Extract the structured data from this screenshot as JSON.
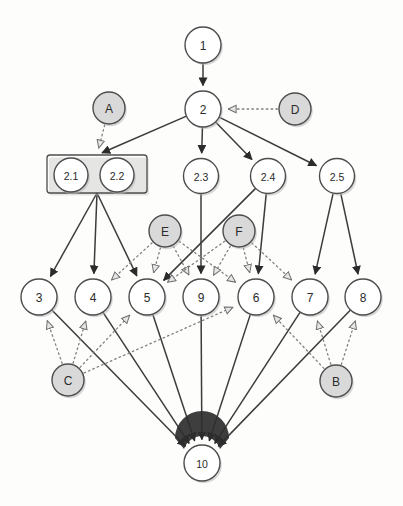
{
  "diagram": {
    "type": "directed-graph",
    "canvas": {
      "width": 403,
      "height": 506
    },
    "styles": {
      "plain_node_fill": "#ffffff",
      "shaded_node_fill": "#d9d9d9",
      "node_stroke": "#4d4d4d",
      "solid_edge_color": "#3c3c3c",
      "dotted_edge_color": "#808080",
      "background": "#fdfdfc"
    },
    "nodes": [
      {
        "id": "n1",
        "label": "1",
        "x": 203,
        "y": 45,
        "r": 18,
        "kind": "plain"
      },
      {
        "id": "n2",
        "label": "2",
        "x": 203,
        "y": 109,
        "r": 18,
        "kind": "plain"
      },
      {
        "id": "nA",
        "label": "A",
        "x": 109,
        "y": 108,
        "r": 16,
        "kind": "shaded"
      },
      {
        "id": "nD",
        "label": "D",
        "x": 295,
        "y": 109,
        "r": 16,
        "kind": "shaded"
      },
      {
        "id": "n21",
        "label": "2.1",
        "x": 71,
        "y": 175,
        "r": 17,
        "kind": "plain"
      },
      {
        "id": "n22",
        "label": "2.2",
        "x": 117,
        "y": 175,
        "r": 17,
        "kind": "plain"
      },
      {
        "id": "n23",
        "label": "2.3",
        "x": 201,
        "y": 176,
        "r": 17.5,
        "kind": "plain"
      },
      {
        "id": "n24",
        "label": "2.4",
        "x": 268,
        "y": 176,
        "r": 17.5,
        "kind": "plain"
      },
      {
        "id": "n25",
        "label": "2.5",
        "x": 337,
        "y": 176,
        "r": 17.5,
        "kind": "plain"
      },
      {
        "id": "nE",
        "label": "E",
        "x": 165,
        "y": 231,
        "r": 16,
        "kind": "shaded"
      },
      {
        "id": "nF",
        "label": "F",
        "x": 239,
        "y": 231,
        "r": 16,
        "kind": "shaded"
      },
      {
        "id": "n3",
        "label": "3",
        "x": 39,
        "y": 297,
        "r": 18,
        "kind": "plain"
      },
      {
        "id": "n4",
        "label": "4",
        "x": 93,
        "y": 297,
        "r": 18,
        "kind": "plain"
      },
      {
        "id": "n5",
        "label": "5",
        "x": 147,
        "y": 297,
        "r": 18,
        "kind": "plain"
      },
      {
        "id": "n9",
        "label": "9",
        "x": 201,
        "y": 297,
        "r": 18,
        "kind": "plain"
      },
      {
        "id": "n6",
        "label": "6",
        "x": 256,
        "y": 297,
        "r": 18,
        "kind": "plain"
      },
      {
        "id": "n7",
        "label": "7",
        "x": 310,
        "y": 297,
        "r": 18,
        "kind": "plain"
      },
      {
        "id": "n8",
        "label": "8",
        "x": 363,
        "y": 297,
        "r": 18,
        "kind": "plain"
      },
      {
        "id": "nC",
        "label": "C",
        "x": 68,
        "y": 380,
        "r": 16,
        "kind": "shaded"
      },
      {
        "id": "nB",
        "label": "B",
        "x": 336,
        "y": 381,
        "r": 16,
        "kind": "shaded"
      },
      {
        "id": "n10",
        "label": "10",
        "x": 202,
        "y": 463,
        "r": 18,
        "kind": "plain"
      }
    ],
    "group_box": {
      "label": "group-2.1-2.2",
      "x": 47,
      "y": 155,
      "width": 100,
      "height": 38
    },
    "edges_solid": [
      {
        "from": "n1",
        "to": "n2"
      },
      {
        "from": "n2",
        "to": "box"
      },
      {
        "from": "n2",
        "to": "n23"
      },
      {
        "from": "n2",
        "to": "n24"
      },
      {
        "from": "n2",
        "to": "n25"
      },
      {
        "from": "box",
        "to": "n3"
      },
      {
        "from": "box",
        "to": "n4"
      },
      {
        "from": "box",
        "to": "n5"
      },
      {
        "from": "n23",
        "to": "n9"
      },
      {
        "from": "n24",
        "to": "n5"
      },
      {
        "from": "n24",
        "to": "n6"
      },
      {
        "from": "n25",
        "to": "n7"
      },
      {
        "from": "n25",
        "to": "n8"
      },
      {
        "from": "n3",
        "to": "n10"
      },
      {
        "from": "n4",
        "to": "n10"
      },
      {
        "from": "n5",
        "to": "n10"
      },
      {
        "from": "n9",
        "to": "n10"
      },
      {
        "from": "n6",
        "to": "n10"
      },
      {
        "from": "n7",
        "to": "n10"
      },
      {
        "from": "n8",
        "to": "n10"
      }
    ],
    "edges_dotted": [
      {
        "from": "nD",
        "to": "n2"
      },
      {
        "from": "nA",
        "to": "box"
      },
      {
        "from": "nE",
        "to": "n4"
      },
      {
        "from": "nE",
        "to": "n5"
      },
      {
        "from": "nE",
        "to": "n9"
      },
      {
        "from": "nE",
        "to": "n6"
      },
      {
        "from": "nF",
        "to": "n5"
      },
      {
        "from": "nF",
        "to": "n9"
      },
      {
        "from": "nF",
        "to": "n6"
      },
      {
        "from": "nF",
        "to": "n7"
      },
      {
        "from": "nC",
        "to": "n3"
      },
      {
        "from": "nC",
        "to": "n4"
      },
      {
        "from": "nC",
        "to": "n5"
      },
      {
        "from": "nC",
        "to": "n6"
      },
      {
        "from": "nB",
        "to": "n6"
      },
      {
        "from": "nB",
        "to": "n7"
      },
      {
        "from": "nB",
        "to": "n8"
      }
    ]
  }
}
